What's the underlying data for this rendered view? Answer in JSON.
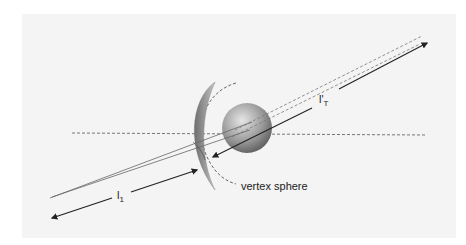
{
  "diagram": {
    "labels": {
      "l1_main": "l",
      "l1_sub": "1",
      "lT_main": "l'",
      "lT_sub": "T",
      "vertex_sphere": "vertex sphere"
    },
    "colors": {
      "background": "#ffffff",
      "panel": "#f4f4f4",
      "line": "#222222",
      "dashed": "#555555",
      "sphere_light": "#d8d8d8",
      "sphere_dark": "#5a5a5a",
      "lens": "#8a8a8a"
    }
  }
}
